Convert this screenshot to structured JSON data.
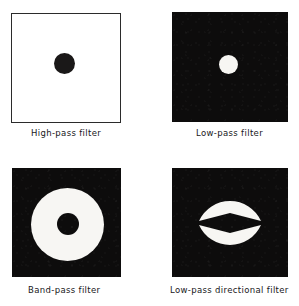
{
  "figure": {
    "background_color": "#ffffff",
    "mask_white": "#f7f6f3",
    "mask_black": "#0d0c0c"
  },
  "panels": [
    {
      "id": "high-pass",
      "caption": "High-pass filter",
      "field": "white",
      "field_color": "#ffffff",
      "border_color": "#2b2b2b",
      "shape": "black-disc-center",
      "shape_color": "#1a1818",
      "disc_diameter_px": 21,
      "square_px": 110
    },
    {
      "id": "low-pass",
      "caption": "Low-pass filter",
      "field": "black",
      "field_color": "#0d0c0c",
      "shape": "white-disc-center",
      "shape_color": "#f7f6f3",
      "disc_diameter_px": 19,
      "square_px": 110
    },
    {
      "id": "band-pass",
      "caption": "Band-pass filter",
      "field": "black",
      "field_color": "#0d0c0c",
      "shape": "white-annulus-center",
      "shape_color": "#f7f6f3",
      "outer_diameter_px": 73,
      "inner_diameter_px": 22,
      "square_px": 109
    },
    {
      "id": "low-pass-directional",
      "caption": "Low-pass directional filter",
      "field": "black",
      "field_color": "#0d0c0c",
      "shape": "white-bowtie-vertical-lunes",
      "shape_color": "#f7f6f3",
      "lobes": 2,
      "lobe_orientation": "top-and-bottom",
      "square_px": 109
    }
  ]
}
